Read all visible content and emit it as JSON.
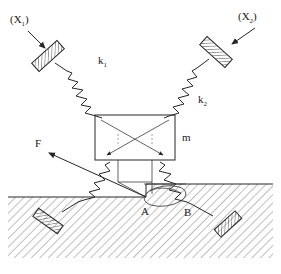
{
  "figure": {
    "type": "mechanical-schematic",
    "background_color": "#ffffff",
    "line_color": "#262626"
  },
  "labels": {
    "x1": "(X",
    "x1_sub": "1",
    "x1_close": ")",
    "x1_full": "(X1)",
    "x2": "(X",
    "x2_sub": "2",
    "x2_close": ")",
    "x2_full": "(X2)",
    "k1": "k",
    "k1_sub": "1",
    "k2": "k",
    "k2_sub": "2",
    "mass": "m",
    "force": "F",
    "point_a": "A",
    "point_b": "B"
  },
  "components": {
    "springs": [
      {
        "name": "spring-k1",
        "label": "k1",
        "orientation": "diagonal-upper-left"
      },
      {
        "name": "spring-k2",
        "label": "k2",
        "orientation": "diagonal-upper-right"
      },
      {
        "name": "spring-lower-left",
        "label": "",
        "orientation": "diagonal-lower-left"
      },
      {
        "name": "spring-lower-right",
        "label": "",
        "orientation": "diagonal-lower-right"
      }
    ],
    "anchors": [
      {
        "name": "anchor-upper-left",
        "style": "hatched-plate"
      },
      {
        "name": "anchor-upper-right",
        "style": "hatched-plate"
      },
      {
        "name": "anchor-lower-left",
        "style": "hatched-plate"
      },
      {
        "name": "anchor-lower-right",
        "style": "hatched-plate"
      }
    ],
    "mass_block": {
      "name": "mass-block",
      "label": "m",
      "shape": "rectangle-with-crossed-arrows"
    },
    "ground": {
      "name": "ground-hatched-region",
      "style": "diagonal-hatch",
      "has_step": true
    },
    "contact_points": [
      "A",
      "B"
    ],
    "force_arrow": {
      "name": "force-arrow-F",
      "label": "F",
      "direction": "up-left"
    }
  }
}
